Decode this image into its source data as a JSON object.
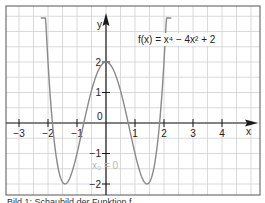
{
  "chart_data": {
    "type": "line",
    "title": "",
    "function_label": "f(x) = x⁴ − 4x² + 2",
    "annotation": "x₀ = 0",
    "xlabel": "x",
    "ylabel": "y",
    "xlim": [
      -3.4,
      5.3
    ],
    "ylim": [
      -2.35,
      3.8
    ],
    "x_ticks": [
      -3,
      -2,
      -1,
      1,
      2,
      3,
      4
    ],
    "x_tick_labels": [
      "−3",
      "−2",
      "−1",
      "1",
      "2",
      "3",
      "4"
    ],
    "y_ticks": [
      -2,
      -1,
      1,
      2
    ],
    "y_tick_labels": [
      "−2",
      "−1",
      "1",
      "2"
    ],
    "origin_label": "0",
    "grid": true,
    "grid_step": 0.5,
    "legend": null,
    "series": [
      {
        "name": "f(x) = x⁴ − 4x² + 2",
        "coefficients": {
          "x4": 1,
          "x2": -4,
          "c": 2
        },
        "x": [
          -2.2,
          -2.0,
          -1.8,
          -1.6,
          -1.414,
          -1.2,
          -1.0,
          -0.8,
          -0.6,
          -0.4,
          -0.2,
          0,
          0.2,
          0.4,
          0.6,
          0.8,
          1.0,
          1.2,
          1.414,
          1.6,
          1.8,
          2.0,
          2.2
        ],
        "values": [
          5.07,
          2.0,
          -0.46,
          -1.69,
          -2.0,
          -1.69,
          -1.0,
          -0.15,
          0.69,
          1.39,
          1.84,
          2.0,
          1.84,
          1.39,
          0.69,
          -0.15,
          -1.0,
          -1.69,
          -2.0,
          -1.69,
          -0.46,
          2.0,
          5.07
        ]
      }
    ],
    "colors": {
      "curve": "#8a8a8a",
      "axis": "#1a1a1a",
      "grid": "#d0d0d0",
      "frame": "#555555",
      "annotation": "#b8b8b8"
    }
  },
  "caption": "Bild 1: Schaubild der Funktion f"
}
